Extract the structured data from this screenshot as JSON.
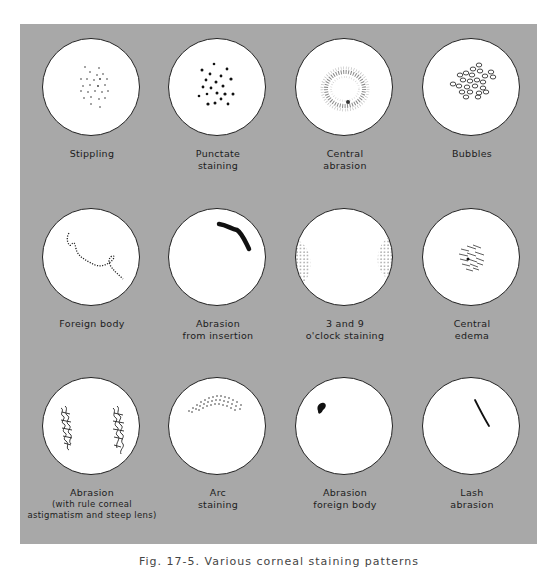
{
  "figure": {
    "background_color": "#a8a8a8",
    "caption": "Fig. 17-5. Various corneal staining patterns",
    "panels": [
      {
        "id": "stippling",
        "label_lines": [
          "Stippling"
        ]
      },
      {
        "id": "punctate-staining",
        "label_lines": [
          "Punctate",
          "staining"
        ]
      },
      {
        "id": "central-abrasion",
        "label_lines": [
          "Central",
          "abrasion"
        ]
      },
      {
        "id": "bubbles",
        "label_lines": [
          "Bubbles"
        ]
      },
      {
        "id": "foreign-body",
        "label_lines": [
          "Foreign body"
        ]
      },
      {
        "id": "abrasion-from-insertion",
        "label_lines": [
          "Abrasion",
          "from insertion"
        ]
      },
      {
        "id": "3-and-9-oclock-staining",
        "label_lines": [
          "3 and 9",
          "o'clock staining"
        ]
      },
      {
        "id": "central-edema",
        "label_lines": [
          "Central",
          "edema"
        ]
      },
      {
        "id": "abrasion-with-rule",
        "label_lines": [
          "Abrasion",
          "(with rule corneal",
          "astigmatism and steep lens)"
        ]
      },
      {
        "id": "arc-staining",
        "label_lines": [
          "Arc",
          "staining"
        ]
      },
      {
        "id": "abrasion-foreign-body",
        "label_lines": [
          "Abrasion",
          "foreign body"
        ]
      },
      {
        "id": "lash-abrasion",
        "label_lines": [
          "Lash",
          "abrasion"
        ]
      }
    ]
  }
}
